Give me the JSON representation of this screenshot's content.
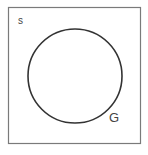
{
  "diagram": {
    "type": "venn",
    "universal_set": {
      "label": "s",
      "border_color": "#7a7a7a"
    },
    "sets": [
      {
        "label": "G",
        "stroke_color": "#333333"
      }
    ]
  }
}
